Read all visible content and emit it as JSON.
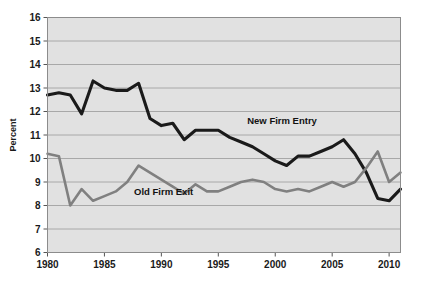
{
  "chart_data": {
    "type": "line",
    "title": "",
    "subtitle": "",
    "xlabel": "",
    "ylabel": "Percent",
    "xlim": [
      1980,
      2011
    ],
    "ylim": [
      6,
      16
    ],
    "grid": true,
    "legend_position": "inline-annotation",
    "x": [
      1980,
      1981,
      1982,
      1983,
      1984,
      1985,
      1986,
      1987,
      1988,
      1989,
      1990,
      1991,
      1992,
      1993,
      1994,
      1995,
      1996,
      1997,
      1998,
      1999,
      2000,
      2001,
      2002,
      2003,
      2004,
      2005,
      2006,
      2007,
      2008,
      2009,
      2010,
      2011
    ],
    "xticks": [
      1980,
      1985,
      1990,
      1995,
      2000,
      2005,
      2010
    ],
    "xticklabels": [
      "1980",
      "1985",
      "1990",
      "1995",
      "2000",
      "2005",
      "2010"
    ],
    "yticks": [
      6,
      7,
      8,
      9,
      10,
      11,
      12,
      13,
      14,
      15,
      16
    ],
    "yticklabels": [
      "6",
      "7",
      "8",
      "9",
      "10",
      "11",
      "12",
      "13",
      "14",
      "15",
      "16"
    ],
    "series": [
      {
        "name": "New Firm Entry",
        "color": "#1a1a1a",
        "width": 3.1,
        "label_x": 2000.6,
        "label_y": 11.45,
        "values": [
          12.7,
          12.8,
          12.7,
          11.9,
          13.3,
          13.0,
          12.9,
          12.9,
          13.2,
          11.7,
          11.4,
          11.5,
          10.8,
          11.2,
          11.2,
          11.2,
          10.9,
          10.7,
          10.5,
          10.2,
          9.9,
          9.7,
          10.1,
          10.1,
          10.3,
          10.5,
          10.8,
          10.2,
          9.4,
          8.3,
          8.2,
          8.7
        ]
      },
      {
        "name": "Old Firm Exit",
        "color": "#808080",
        "width": 2.6,
        "label_x": 1990.2,
        "label_y": 8.45,
        "values": [
          10.2,
          10.1,
          8.0,
          8.7,
          8.2,
          8.4,
          8.6,
          9.0,
          9.7,
          9.4,
          9.1,
          8.8,
          8.5,
          8.9,
          8.6,
          8.6,
          8.8,
          9.0,
          9.1,
          9.0,
          8.7,
          8.6,
          8.7,
          8.6,
          8.8,
          9.0,
          8.8,
          9.0,
          9.6,
          10.3,
          9.0,
          9.4
        ]
      }
    ]
  },
  "plot_style": {
    "plot_bg": "#e1e1e1",
    "grid_color": "#a8a8a8",
    "border_color": "#8c8c8c",
    "page_bg": "#ffffff",
    "text_color": "#1a1a1a"
  }
}
